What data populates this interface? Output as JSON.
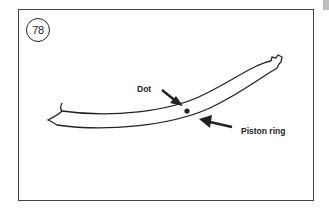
{
  "figure": {
    "number": "78"
  },
  "labels": {
    "dot": "Dot",
    "piston_ring": "Piston ring"
  },
  "colors": {
    "line": "#222222",
    "frame": "#444444",
    "background": "#ffffff",
    "edge_tab": "#bdbdbd"
  }
}
